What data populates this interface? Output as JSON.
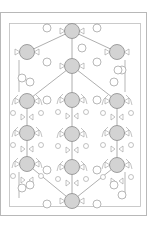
{
  "diagram": {
    "type": "symmetric-network",
    "colors": {
      "background": "#ffffff",
      "outer_border": "#b8b8b8",
      "inner_frame": "#bdbdbd",
      "node_fill": "#d3d3d3",
      "node_stroke": "#8a8a8a",
      "line": "#9a9a9a",
      "small_node_fill": "#ffffff"
    },
    "outer_border": {
      "x": 0,
      "y": 12,
      "w": 146,
      "h": 203
    },
    "inner_frame": {
      "x": 9,
      "y": 23,
      "w": 131,
      "h": 183
    },
    "nodes": [
      {
        "id": "top",
        "x": 72,
        "y": 31
      },
      {
        "id": "upper-left",
        "x": 27,
        "y": 52
      },
      {
        "id": "upper-right",
        "x": 117,
        "y": 52
      },
      {
        "id": "center-upper",
        "x": 72,
        "y": 66
      },
      {
        "id": "row1-left",
        "x": 27,
        "y": 101
      },
      {
        "id": "row1-center",
        "x": 72,
        "y": 100
      },
      {
        "id": "row1-right",
        "x": 117,
        "y": 101
      },
      {
        "id": "row2-left",
        "x": 27,
        "y": 133
      },
      {
        "id": "row2-center",
        "x": 72,
        "y": 134
      },
      {
        "id": "row2-right",
        "x": 117,
        "y": 133
      },
      {
        "id": "row3-left",
        "x": 27,
        "y": 164
      },
      {
        "id": "row3-center",
        "x": 72,
        "y": 167
      },
      {
        "id": "row3-right",
        "x": 117,
        "y": 165
      },
      {
        "id": "bottom",
        "x": 72,
        "y": 201
      }
    ],
    "edges": [
      [
        "top",
        "upper-left"
      ],
      [
        "top",
        "upper-right"
      ],
      [
        "top",
        "center-upper"
      ],
      [
        "center-upper",
        "row1-left"
      ],
      [
        "center-upper",
        "row1-right"
      ],
      [
        "center-upper",
        "row1-center"
      ],
      [
        "row1-left",
        "row2-left"
      ],
      [
        "row2-left",
        "row3-left"
      ],
      [
        "row1-center",
        "row2-center"
      ],
      [
        "row2-center",
        "row3-center"
      ],
      [
        "row1-right",
        "row2-right"
      ],
      [
        "row2-right",
        "row3-right"
      ],
      [
        "row3-left",
        "bottom"
      ],
      [
        "row3-right",
        "bottom"
      ],
      [
        "row3-center",
        "bottom"
      ]
    ],
    "small_nodes": [
      {
        "x": 47,
        "y": 28
      },
      {
        "x": 97,
        "y": 28
      },
      {
        "x": 47,
        "y": 62
      },
      {
        "x": 97,
        "y": 62
      },
      {
        "x": 82,
        "y": 48
      },
      {
        "x": 22,
        "y": 78
      },
      {
        "x": 122,
        "y": 70
      },
      {
        "x": 118,
        "y": 70
      },
      {
        "x": 30,
        "y": 82
      },
      {
        "x": 114,
        "y": 82
      },
      {
        "x": 47,
        "y": 100
      },
      {
        "x": 97,
        "y": 100
      },
      {
        "x": 47,
        "y": 170
      },
      {
        "x": 97,
        "y": 170
      },
      {
        "x": 30,
        "y": 185
      },
      {
        "x": 114,
        "y": 185
      },
      {
        "x": 47,
        "y": 204
      },
      {
        "x": 97,
        "y": 204
      },
      {
        "x": 122,
        "y": 195
      },
      {
        "x": 22,
        "y": 188
      }
    ]
  }
}
